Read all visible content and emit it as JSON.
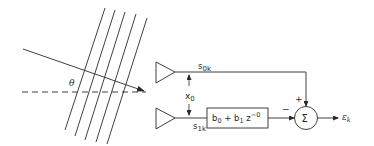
{
  "diagram": {
    "wavefront": {
      "angle_label": "θ",
      "line_count": 5
    },
    "sensors": {
      "upper_signal": "s",
      "upper_subscript": "0k",
      "lower_signal": "s",
      "lower_subscript": "1k",
      "spacing_label": "x",
      "spacing_subscript": "0"
    },
    "filter": {
      "label_b0": "b",
      "sub_b0": "0",
      "plus": " + b",
      "sub_b1": "1",
      "z": " z",
      "exp": "−0"
    },
    "summer": {
      "symbol": "Σ",
      "plus_sign": "+",
      "minus_sign": "−"
    },
    "output": {
      "label": "ε",
      "subscript": "k"
    },
    "colors": {
      "stroke": "#2a2a2a",
      "background": "#ffffff"
    }
  }
}
